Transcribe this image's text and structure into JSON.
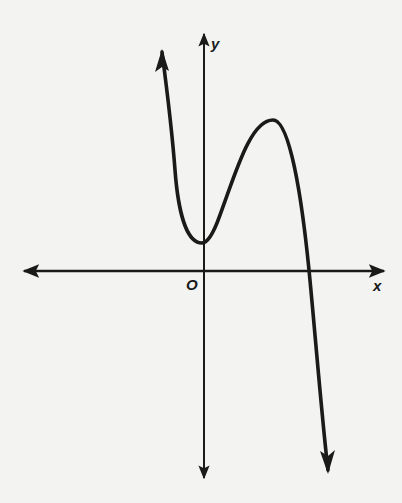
{
  "figure": {
    "type": "function-graph",
    "axes": {
      "x_label": "x",
      "y_label": "y",
      "origin_label": "O"
    },
    "curve": {
      "end_behavior_left": "rises (arrow up)",
      "end_behavior_right": "falls (arrow down)",
      "local_min": "on y-axis, above x-axis",
      "local_max": "right of y-axis, above x-axis",
      "x_intercepts": 1,
      "y_intercept": "positive"
    },
    "colors": {
      "background": "#f3f3f1",
      "ink": "#1a1a1a"
    }
  }
}
